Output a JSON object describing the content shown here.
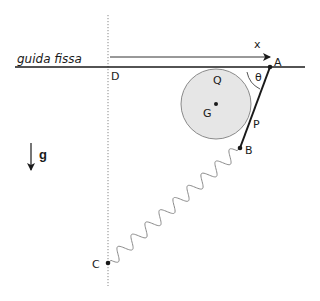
{
  "diagram": {
    "type": "mechanics-schematic",
    "labels": {
      "guide": "guida fissa",
      "origin": "D",
      "x_axis": "x",
      "point_A": "A",
      "point_B": "B",
      "point_C": "C",
      "point_P": "P",
      "point_Q": "Q",
      "center_G": "G",
      "angle": "θ",
      "gravity": "g"
    },
    "elements": {
      "guide_line": {
        "x1": 15,
        "y1": 67,
        "x2": 305,
        "y2": 67
      },
      "vertical_axis": {
        "x": 108,
        "y1": 15,
        "y2": 286,
        "style": "dotted"
      },
      "x_arrow": {
        "x1": 110,
        "y1": 57,
        "x2": 270,
        "y2": 57
      },
      "disk": {
        "cx": 216,
        "cy": 104,
        "r": 35,
        "fill": "#e6e6e6",
        "stroke": "#888888"
      },
      "rod": {
        "from": "A",
        "to": "B"
      },
      "spring": {
        "from": "B",
        "to": "C",
        "coils": 9
      },
      "gravity_arrow": {
        "x": 31,
        "y1": 143,
        "y2": 170
      }
    },
    "points": {
      "A": [
        270,
        67
      ],
      "B": [
        240,
        148
      ],
      "C": [
        108,
        263
      ],
      "G": [
        216,
        104
      ]
    },
    "colors": {
      "line": "#1a1a1a",
      "disk_fill": "#e6e6e6",
      "disk_stroke": "#8a8a8a",
      "spring": "#8a8a8a",
      "dotted": "#888888"
    }
  }
}
